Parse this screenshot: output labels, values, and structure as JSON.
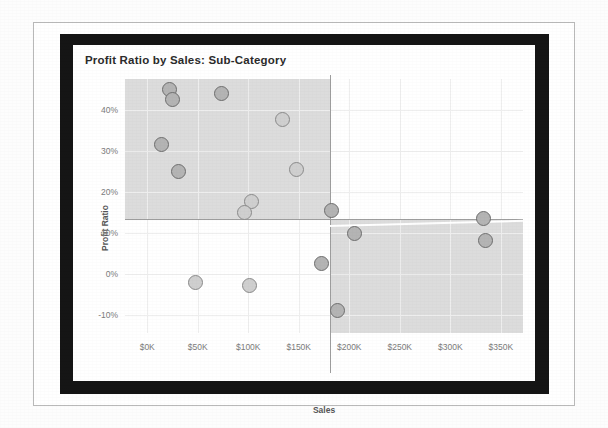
{
  "chart_data": {
    "type": "scatter",
    "title": "Profit Ratio by Sales: Sub-Category",
    "xlabel": "Sales",
    "ylabel": "Profit Ratio",
    "xlim": [
      -22000,
      372000
    ],
    "ylim": [
      -0.145,
      0.475
    ],
    "xticks": [
      "$0K",
      "$50K",
      "$100K",
      "$150K",
      "$200K",
      "$250K",
      "$300K",
      "$350K"
    ],
    "xtick_values": [
      0,
      50000,
      100000,
      150000,
      200000,
      250000,
      300000,
      350000
    ],
    "yticks": [
      "40%",
      "30%",
      "20%",
      "10%",
      "0%",
      "-10%"
    ],
    "ytick_values": [
      0.4,
      0.3,
      0.2,
      0.1,
      0.0,
      -0.1
    ],
    "grid": true,
    "legend": "none",
    "reference_lines": {
      "vertical_x": 125000,
      "horizontal_y": 0.185,
      "trend_line": "faint white diagonal across lower-right quadrant"
    },
    "shaded_quadrants": [
      {
        "name": "upper-left",
        "x_range": [
          10000,
          125000
        ],
        "y_range": [
          0.185,
          0.475
        ],
        "color": "#dcdcdc"
      },
      {
        "name": "lower-right",
        "x_range": [
          125000,
          372000
        ],
        "y_range": [
          -0.145,
          0.185
        ],
        "color": "#dcdcdc"
      }
    ],
    "points": [
      {
        "x": 22000,
        "y": 0.45,
        "shade": "dark"
      },
      {
        "x": 25000,
        "y": 0.425,
        "shade": "dark"
      },
      {
        "x": 74000,
        "y": 0.44,
        "shade": "dark"
      },
      {
        "x": 14000,
        "y": 0.315,
        "shade": "dark"
      },
      {
        "x": 31000,
        "y": 0.25,
        "shade": "dark"
      },
      {
        "x": 134000,
        "y": 0.375,
        "shade": "light"
      },
      {
        "x": 148000,
        "y": 0.255,
        "shade": "light"
      },
      {
        "x": 103000,
        "y": 0.175,
        "shade": "light"
      },
      {
        "x": 96000,
        "y": 0.148,
        "shade": "light"
      },
      {
        "x": 48000,
        "y": -0.022,
        "shade": "light"
      },
      {
        "x": 101000,
        "y": -0.028,
        "shade": "light"
      },
      {
        "x": 182000,
        "y": 0.155,
        "shade": "dark"
      },
      {
        "x": 205000,
        "y": 0.097,
        "shade": "dark"
      },
      {
        "x": 173000,
        "y": 0.025,
        "shade": "dark"
      },
      {
        "x": 188000,
        "y": -0.09,
        "shade": "dark"
      },
      {
        "x": 333000,
        "y": 0.135,
        "shade": "dark"
      },
      {
        "x": 335000,
        "y": 0.082,
        "shade": "dark"
      }
    ]
  },
  "colors": {
    "frame": "#151515",
    "quadrant_shade": "#dcdcdc",
    "mark_fill_dark": "#b4b4b4",
    "mark_fill_light": "#cfcfcf",
    "mark_stroke": "#6e6e6e",
    "axis_text": "#7b7b7b",
    "title_text": "#2b2b2b"
  }
}
